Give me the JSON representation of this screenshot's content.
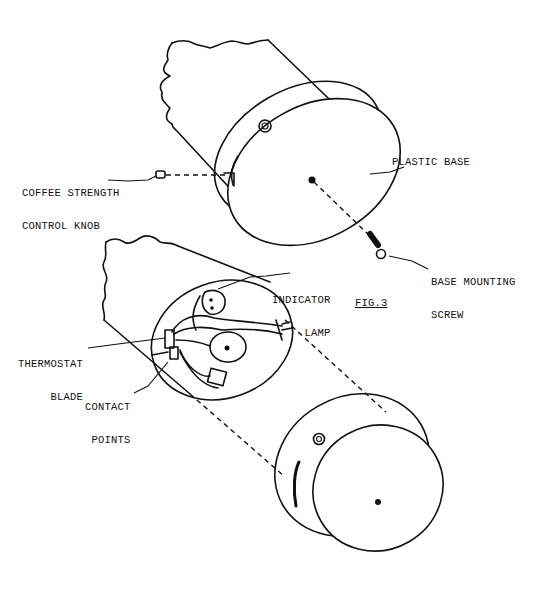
{
  "figure": {
    "title": "FIG.3",
    "labels": {
      "coffee_strength_knob": [
        "COFFEE STRENGTH",
        "CONTROL KNOB"
      ],
      "plastic_base": "PLASTIC BASE",
      "base_mounting_screw": [
        "BASE MOUNTING",
        "SCREW"
      ],
      "indicator_lamp": [
        "INDICATOR",
        "LAMP"
      ],
      "thermostat_blade": [
        "THERMOSTAT",
        "BLADE"
      ],
      "contact_points": [
        "CONTACT",
        "POINTS"
      ]
    }
  }
}
